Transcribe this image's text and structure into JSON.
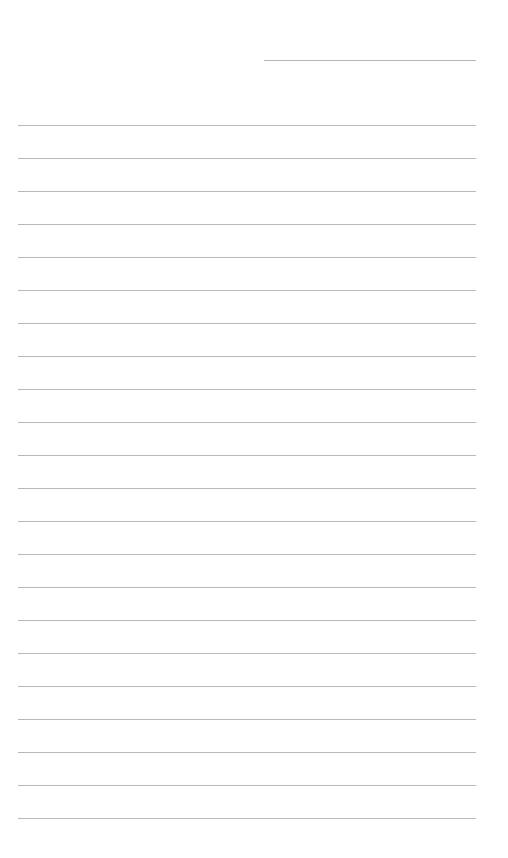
{
  "page": {
    "type": "lined-paper",
    "background_color": "#ffffff",
    "line_color": "#b8b8b8"
  },
  "header_line": {
    "purpose": "date-or-name-field",
    "x_start": 264,
    "x_end": 476,
    "y": 60
  },
  "ruled_lines": {
    "count": 22,
    "first_y": 125,
    "spacing": 33,
    "x_start": 18,
    "x_end": 476
  }
}
